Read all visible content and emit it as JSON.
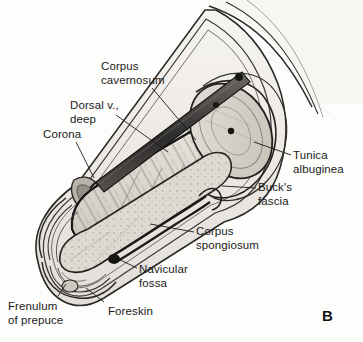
{
  "figure": {
    "panel_letter": "B",
    "type": "anatomical-illustration",
    "background_color": "#fdfdfc",
    "ink_color": "#1a1a1a"
  },
  "labels": {
    "corpus_cavernosum": "Corpus\ncavernosum",
    "dorsal_vein_deep": "Dorsal v.,\ndeep",
    "corona": "Corona",
    "tunica_albuginea": "Tunica\nalbuginea",
    "bucks_fascia": "Buck's\nfascia",
    "corpus_spongiosum": "Corpus\nspongiosum",
    "navicular_fossa": "Navicular\nfossa",
    "foreskin": "Foreskin",
    "frenulum_of_prepuce": "Frenulum\nof prepuce"
  },
  "label_positions": {
    "corpus_cavernosum": {
      "x": 101,
      "y": 60
    },
    "dorsal_vein_deep": {
      "x": 70,
      "y": 99
    },
    "corona": {
      "x": 43,
      "y": 128
    },
    "tunica_albuginea": {
      "x": 293,
      "y": 149
    },
    "bucks_fascia": {
      "x": 258,
      "y": 181
    },
    "corpus_spongiosum": {
      "x": 196,
      "y": 225
    },
    "navicular_fossa": {
      "x": 139,
      "y": 263
    },
    "foreskin": {
      "x": 108,
      "y": 305
    },
    "frenulum_of_prepuce": {
      "x": 8,
      "y": 300
    },
    "panel_letter": {
      "x": 322,
      "y": 307
    }
  }
}
